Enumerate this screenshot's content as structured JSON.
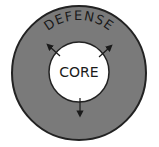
{
  "diagram": {
    "outer_ring": {
      "label": "DEFENSE",
      "color": "#7a7a7a"
    },
    "inner_circle": {
      "label": "CORE",
      "color": "#ffffff"
    },
    "arrows": [
      "up-left",
      "up-right",
      "down"
    ]
  }
}
